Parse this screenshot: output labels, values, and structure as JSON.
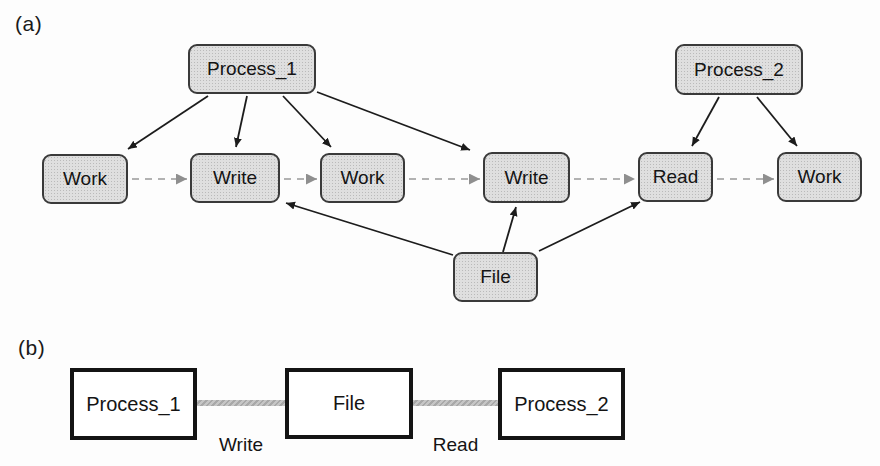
{
  "panel_a": {
    "tag": "(a)",
    "nodes": {
      "process_1": "Process_1",
      "process_2": "Process_2",
      "work_1": "Work",
      "write_1": "Write",
      "work_2": "Work",
      "write_2": "Write",
      "read": "Read",
      "work_3": "Work",
      "file": "File"
    },
    "solid_edges": [
      [
        "Process_1",
        "Work"
      ],
      [
        "Process_1",
        "Write"
      ],
      [
        "Process_1",
        "Work"
      ],
      [
        "Process_1",
        "Write"
      ],
      [
        "Process_2",
        "Read"
      ],
      [
        "Process_2",
        "Work"
      ],
      [
        "File",
        "Write"
      ],
      [
        "File",
        "Write"
      ],
      [
        "File",
        "Read"
      ]
    ],
    "dashed_sequence": [
      "Work",
      "Write",
      "Work",
      "Write",
      "Read",
      "Work"
    ]
  },
  "panel_b": {
    "tag": "(b)",
    "nodes": {
      "process_1": "Process_1",
      "file": "File",
      "process_2": "Process_2"
    },
    "edge_labels": {
      "write": "Write",
      "read": "Read"
    }
  },
  "colors": {
    "background": "#fdfdfd",
    "node_fill": "#dfdfdf",
    "node_border": "#3a3a3a",
    "solid_arrow": "#1c1c1c",
    "dashed_arrow": "#b2b2b2",
    "dashed_arrowhead": "#8f8f8f",
    "connector_gray": "#b5b5b5",
    "panel_b_box_border": "#141414",
    "text": "#141414"
  }
}
